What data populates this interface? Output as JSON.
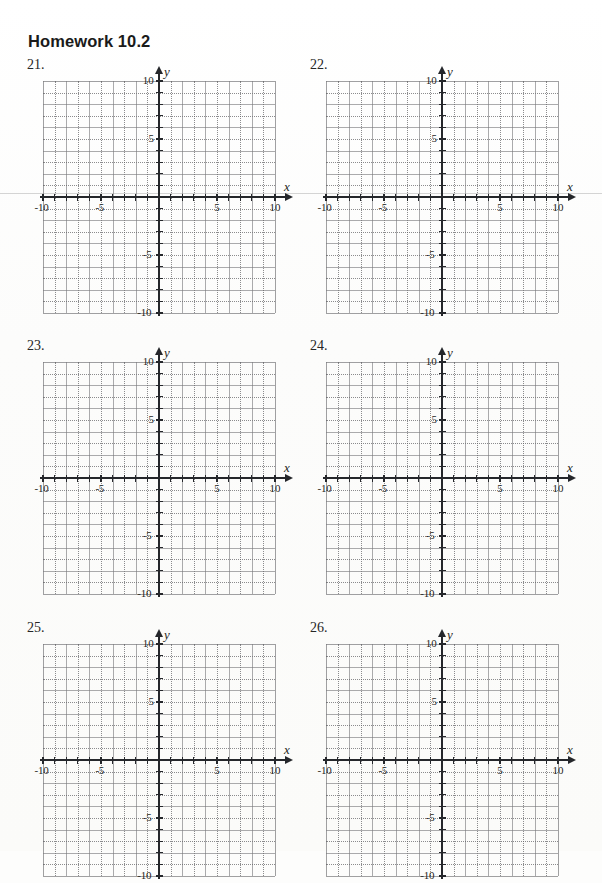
{
  "document": {
    "title": "Homework 10.2",
    "type": "math-worksheet",
    "page_width": 602,
    "page_height": 851,
    "background_color": "#fdfdfc",
    "ink_color": "#25272b"
  },
  "axis": {
    "x_label": "x",
    "y_label": "y",
    "min": -10,
    "max": 10,
    "step": 1,
    "labeled_ticks_x": [
      "-10",
      "-5",
      "5",
      "10"
    ],
    "labeled_ticks_y": [
      "10",
      "5",
      "-5",
      "-10"
    ],
    "label_values_x": [
      -10,
      -5,
      5,
      10
    ],
    "label_values_y": [
      10,
      5,
      -5,
      -10
    ],
    "grid": "on",
    "grid_style": "alternating solid and dotted lines, 1 unit spacing"
  },
  "chart_data": [
    {
      "type": "scatter",
      "title": "21.",
      "xlabel": "x",
      "ylabel": "y",
      "xlim": [
        -10,
        10
      ],
      "ylim": [
        -10,
        10
      ],
      "xticks": [
        -10,
        -5,
        5,
        10
      ],
      "yticks": [
        10,
        5,
        -5,
        -10
      ],
      "grid": true,
      "series": [],
      "annotations": []
    },
    {
      "type": "scatter",
      "title": "22.",
      "xlabel": "x",
      "ylabel": "y",
      "xlim": [
        -10,
        10
      ],
      "ylim": [
        -10,
        10
      ],
      "xticks": [
        -10,
        -5,
        5,
        10
      ],
      "yticks": [
        10,
        5,
        -5,
        -10
      ],
      "grid": true,
      "series": [],
      "annotations": []
    },
    {
      "type": "scatter",
      "title": "23.",
      "xlabel": "x",
      "ylabel": "y",
      "xlim": [
        -10,
        10
      ],
      "ylim": [
        -10,
        10
      ],
      "xticks": [
        -10,
        -5,
        5,
        10
      ],
      "yticks": [
        10,
        5,
        -5,
        -10
      ],
      "grid": true,
      "series": [],
      "annotations": []
    },
    {
      "type": "scatter",
      "title": "24.",
      "xlabel": "x",
      "ylabel": "y",
      "xlim": [
        -10,
        10
      ],
      "ylim": [
        -10,
        10
      ],
      "xticks": [
        -10,
        -5,
        5,
        10
      ],
      "yticks": [
        10,
        5,
        -5,
        -10
      ],
      "grid": true,
      "series": [],
      "annotations": []
    },
    {
      "type": "scatter",
      "title": "25.",
      "xlabel": "x",
      "ylabel": "y",
      "xlim": [
        -10,
        10
      ],
      "ylim": [
        -10,
        10
      ],
      "xticks": [
        -10,
        -5,
        5,
        10
      ],
      "yticks": [
        10,
        5,
        -5,
        -10
      ],
      "grid": true,
      "series": [],
      "annotations": [],
      "note": "clipped by page bottom"
    },
    {
      "type": "scatter",
      "title": "26.",
      "xlabel": "x",
      "ylabel": "y",
      "xlim": [
        -10,
        10
      ],
      "ylim": [
        -10,
        10
      ],
      "xticks": [
        -10,
        -5,
        5,
        10
      ],
      "yticks": [
        10,
        5,
        -5,
        -10
      ],
      "grid": true,
      "series": [],
      "annotations": [],
      "note": "clipped by page bottom"
    }
  ],
  "problems": [
    {
      "number": "21.",
      "left": 27,
      "top": 57,
      "graph_left": 16,
      "graph_top": 24
    },
    {
      "number": "22.",
      "left": 310,
      "top": 57,
      "graph_left": 16,
      "graph_top": 24
    },
    {
      "number": "23.",
      "left": 27,
      "top": 338,
      "graph_left": 16,
      "graph_top": 24
    },
    {
      "number": "24.",
      "left": 310,
      "top": 338,
      "graph_left": 16,
      "graph_top": 24
    },
    {
      "number": "25.",
      "left": 27,
      "top": 620,
      "graph_left": 16,
      "graph_top": 24
    },
    {
      "number": "26.",
      "left": 310,
      "top": 620,
      "graph_left": 16,
      "graph_top": 24
    }
  ],
  "layout": {
    "cell_px": 11.6,
    "units": 20,
    "axis_overhang": 10,
    "artifact_y": 193
  }
}
